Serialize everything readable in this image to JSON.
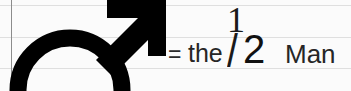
{
  "page": {
    "background_color": "#fbfbfb",
    "paper": {
      "rule_color": "#dfdfdf",
      "margin_line_color": "#8c8c8c"
    }
  },
  "symbol": {
    "name": "mars-male-symbol",
    "description": "circle with diagonal arrow pointing up-right",
    "color": "#000000"
  },
  "equation": {
    "equals": "=",
    "article": "the",
    "fraction": {
      "numerator": "1",
      "slash": "/",
      "denominator": "2",
      "value": "1/2"
    },
    "noun": "Man",
    "full_text": "= the 1/2 Man",
    "text_color": "#262626"
  }
}
